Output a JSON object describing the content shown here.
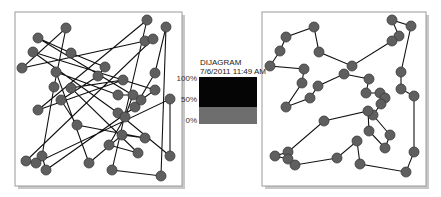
{
  "legend": {
    "title": "DIJAGRAM",
    "date": "7/6/2011 11:49 AM",
    "ticks": [
      {
        "label": "100%",
        "y": 79
      },
      {
        "label": "50%",
        "y": 100
      },
      {
        "label": "0%",
        "y": 121
      }
    ],
    "bar": {
      "x": 199,
      "y": 77,
      "w": 58,
      "h": 47,
      "top_color": "#050505",
      "top_h": 30,
      "bottom_color": "#6e6e6e"
    }
  },
  "colors": {
    "node_fill": "#5f5f5f",
    "node_stroke": "#3a3a3a",
    "edge": "#111111",
    "frame": "#9a9a9a",
    "shadow": "#c8c8c8"
  },
  "panels": [
    {
      "name": "random-tour",
      "frame": {
        "x": 15,
        "y": 12,
        "w": 167,
        "h": 174
      },
      "node_radius": 5,
      "tour": [
        [
          147,
          20
        ],
        [
          112,
          170
        ],
        [
          161,
          176
        ],
        [
          166,
          27
        ],
        [
          155,
          73
        ],
        [
          135,
          107
        ],
        [
          46,
          170
        ],
        [
          42,
          156
        ],
        [
          54,
          87
        ],
        [
          66,
          28
        ],
        [
          22,
          68
        ],
        [
          145,
          41
        ],
        [
          153,
          39
        ],
        [
          26,
          161
        ],
        [
          36,
          163
        ],
        [
          170,
          99
        ],
        [
          170,
          156
        ],
        [
          118,
          113
        ],
        [
          33,
          52
        ],
        [
          155,
          90
        ],
        [
          141,
          100
        ],
        [
          38,
          38
        ],
        [
          71,
          53
        ],
        [
          105,
          67
        ],
        [
          98,
          76
        ],
        [
          61,
          100
        ],
        [
          77,
          125
        ],
        [
          145,
          138
        ],
        [
          122,
          135
        ],
        [
          89,
          163
        ],
        [
          56,
          72
        ],
        [
          118,
          95
        ],
        [
          133,
          95
        ],
        [
          125,
          117
        ],
        [
          109,
          145
        ],
        [
          138,
          153
        ],
        [
          71,
          88
        ],
        [
          123,
          80
        ],
        [
          38,
          110
        ]
      ],
      "closed": true
    },
    {
      "name": "optimized-tour",
      "frame": {
        "x": 262,
        "y": 12,
        "w": 164,
        "h": 174
      },
      "node_radius": 5,
      "tour": [
        [
          411,
          26
        ],
        [
          392,
          20
        ],
        [
          399,
          36
        ],
        [
          392,
          41
        ],
        [
          352,
          66
        ],
        [
          319,
          52
        ],
        [
          314,
          27
        ],
        [
          286,
          37
        ],
        [
          280,
          51
        ],
        [
          270,
          66
        ],
        [
          304,
          69
        ],
        [
          302,
          83
        ],
        [
          286,
          107
        ],
        [
          310,
          98
        ],
        [
          318,
          86
        ],
        [
          344,
          74
        ],
        [
          369,
          79
        ],
        [
          366,
          93
        ],
        [
          380,
          93
        ],
        [
          385,
          98
        ],
        [
          381,
          104
        ],
        [
          373,
          115
        ],
        [
          390,
          135
        ],
        [
          385,
          148
        ],
        [
          369,
          131
        ],
        [
          368,
          111
        ],
        [
          324,
          121
        ],
        [
          288,
          152
        ],
        [
          275,
          156
        ],
        [
          288,
          159
        ],
        [
          295,
          165
        ],
        [
          337,
          158
        ],
        [
          357,
          141
        ],
        [
          360,
          164
        ],
        [
          406,
          172
        ],
        [
          414,
          152
        ],
        [
          414,
          96
        ],
        [
          401,
          89
        ],
        [
          401,
          72
        ]
      ],
      "closed": true
    }
  ]
}
